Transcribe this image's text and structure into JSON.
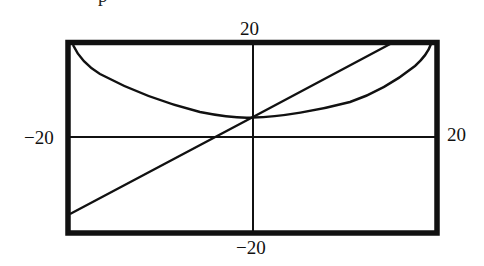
{
  "figure": {
    "top_fragment": "p"
  },
  "chart_data": {
    "type": "line",
    "title": "",
    "xlabel": "",
    "ylabel": "",
    "xlim": [
      -20,
      20
    ],
    "ylim": [
      -20,
      20
    ],
    "grid": false,
    "tick_labels": {
      "top": "20",
      "bottom": "−20",
      "left": "−20",
      "right": "20"
    },
    "series": [
      {
        "name": "line",
        "description": "straight line with slope ~1, y-intercept ~4",
        "x": [
          -20,
          0,
          15.5
        ],
        "y": [
          -16,
          4.2,
          20
        ]
      },
      {
        "name": "curve",
        "description": "U-shaped curve with minimum ~4 at x=0, reaching y=20 near x=±19.5",
        "x": [
          -19.5,
          -19,
          -17,
          -16.5,
          -11,
          -5.7,
          0,
          5.2,
          10.6,
          16,
          18.7,
          19.2
        ],
        "y": [
          20,
          19,
          15,
          13,
          8,
          5,
          4.2,
          5,
          7.3,
          12.4,
          17.2,
          20
        ]
      }
    ]
  },
  "render": {
    "frame": {
      "x": 68,
      "y": 42.5,
      "w": 369,
      "h": 190.5,
      "stroke": 5.5,
      "color": "#111111"
    },
    "axes": {
      "x_axis_y": 137,
      "y_axis_x": 253,
      "stroke": 2,
      "color": "#111111"
    },
    "line_path": "M 70 214 L 253 117 L 392 43",
    "curve_path": "M 73 45 C 80 60, 90 68, 100 74 C 130 90, 160 102, 200 112 C 225 117, 245 118, 253 117.5 C 280 117, 320 110, 350 102 C 380 92, 400 78, 415 66 C 425 57, 429 50, 431 44",
    "curve_stroke": 2.4,
    "line_stroke": 2.4
  }
}
